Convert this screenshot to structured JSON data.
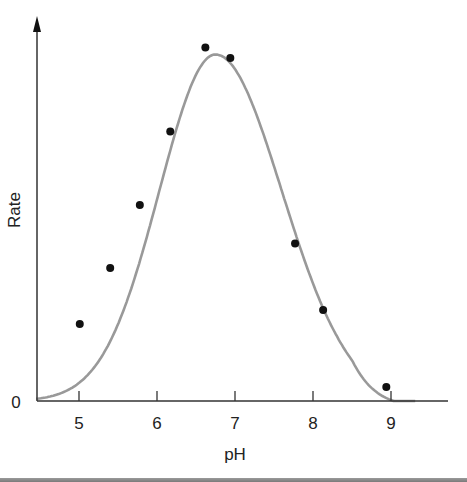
{
  "chart_data": {
    "type": "scatter",
    "title": "",
    "xlabel": "pH",
    "ylabel": "Rate",
    "xlim": [
      4.45,
      9.73
    ],
    "ylim": [
      0,
      1.1
    ],
    "x_ticks": [
      5,
      6,
      7,
      8,
      9
    ],
    "y_ticks": [
      0
    ],
    "y_tick_labels": [
      "0"
    ],
    "grid": false,
    "legend": null,
    "series": [
      {
        "name": "measured",
        "kind": "points",
        "color": "#111111",
        "x": [
          5.01,
          5.4,
          5.78,
          6.17,
          6.62,
          6.94,
          7.77,
          8.13,
          8.94
        ],
        "y": [
          0.22,
          0.38,
          0.56,
          0.77,
          1.01,
          0.98,
          0.45,
          0.26,
          0.04
        ]
      },
      {
        "name": "fitted curve",
        "kind": "line",
        "color": "#999999",
        "shape": "bell",
        "peak_x": 6.75,
        "peak_y": 0.99,
        "start": [
          4.45,
          0.045
        ],
        "end": [
          9.3,
          0.0
        ]
      }
    ]
  },
  "axes": {
    "x_label": "pH",
    "y_label": "Rate",
    "origin_label": "0",
    "x_tick_labels": [
      "5",
      "6",
      "7",
      "8",
      "9"
    ]
  },
  "colors": {
    "curve": "#999999",
    "points": "#111111",
    "axis": "#333333",
    "bottom_bar": "#888888"
  }
}
